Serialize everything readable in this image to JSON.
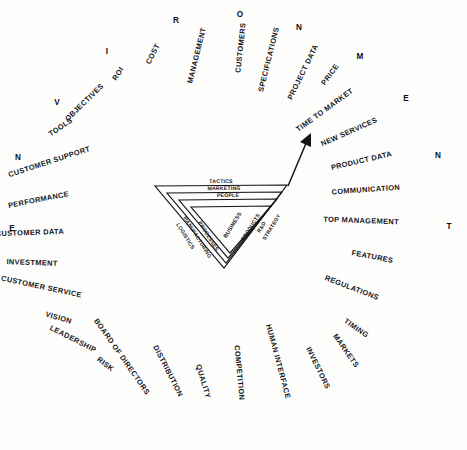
{
  "figure": {
    "background_color": "#fdfdfc",
    "ink_color": "#141418"
  },
  "environment_word": {
    "text": "ENVIRONMENT",
    "letters": [
      "E",
      "N",
      "V",
      "I",
      "R",
      "O",
      "N",
      "M",
      "E",
      "N",
      "T"
    ]
  },
  "env_letters": [
    {
      "char": "E",
      "x": 12,
      "y": 231
    },
    {
      "char": "N",
      "x": 18,
      "y": 160
    },
    {
      "char": "V",
      "x": 57,
      "y": 105
    },
    {
      "char": "I",
      "x": 107,
      "y": 54
    },
    {
      "char": "R",
      "x": 176,
      "y": 23
    },
    {
      "char": "O",
      "x": 240,
      "y": 17
    },
    {
      "char": "N",
      "x": 299,
      "y": 30
    },
    {
      "char": "M",
      "x": 360,
      "y": 59
    },
    {
      "char": "E",
      "x": 406,
      "y": 101
    },
    {
      "char": "N",
      "x": 438,
      "y": 158
    },
    {
      "char": "T",
      "x": 449,
      "y": 229
    }
  ],
  "ring_labels": [
    {
      "text": "ROI",
      "x": 120,
      "y": 75,
      "rot": -56
    },
    {
      "text": "COST",
      "x": 155,
      "y": 55,
      "rot": -63
    },
    {
      "text": "MANAGEMENT",
      "x": 199,
      "y": 56,
      "rot": -76
    },
    {
      "text": "CUSTOMERS",
      "x": 243,
      "y": 48,
      "rot": -84
    },
    {
      "text": "SPECIFICATIONS",
      "x": 271,
      "y": 60,
      "rot": -76
    },
    {
      "text": "PROJECT DATA",
      "x": 305,
      "y": 73,
      "rot": -64
    },
    {
      "text": "PRICE",
      "x": 332,
      "y": 76,
      "rot": -54
    },
    {
      "text": "TIME TO MARKET",
      "x": 326,
      "y": 112,
      "rot": -36
    },
    {
      "text": "NEW SERVICES",
      "x": 350,
      "y": 134,
      "rot": -24
    },
    {
      "text": "PRODUCT DATA",
      "x": 362,
      "y": 163,
      "rot": -13
    },
    {
      "text": "COMMUNICATION",
      "x": 366,
      "y": 192,
      "rot": -4
    },
    {
      "text": "TOP MANAGEMENT",
      "x": 361,
      "y": 223,
      "rot": 2
    },
    {
      "text": "FEATURES",
      "x": 372,
      "y": 259,
      "rot": 11
    },
    {
      "text": "REGULATIONS",
      "x": 351,
      "y": 290,
      "rot": 21
    },
    {
      "text": "TIMING",
      "x": 355,
      "y": 330,
      "rot": 35
    },
    {
      "text": "MARKETS",
      "x": 344,
      "y": 352,
      "rot": 55
    },
    {
      "text": "INVESTORS",
      "x": 316,
      "y": 369,
      "rot": 64
    },
    {
      "text": "HUMAN INTERFACE",
      "x": 276,
      "y": 362,
      "rot": 75
    },
    {
      "text": "COMPETITION",
      "x": 237,
      "y": 373,
      "rot": 85
    },
    {
      "text": "QUALITY",
      "x": 201,
      "y": 382,
      "rot": 73
    },
    {
      "text": "DISTRIBUTION",
      "x": 166,
      "y": 372,
      "rot": 63
    },
    {
      "text": "BOARD OF DIRECTORS",
      "x": 120,
      "y": 358,
      "rot": 55
    },
    {
      "text": "RISK",
      "x": 104,
      "y": 366,
      "rot": 37
    },
    {
      "text": "LEADERSHIP",
      "x": 72,
      "y": 341,
      "rot": 27
    },
    {
      "text": "VISION",
      "x": 58,
      "y": 320,
      "rot": 16
    },
    {
      "text": "CUSTOMER SERVICE",
      "x": 41,
      "y": 289,
      "rot": 12
    },
    {
      "text": "INVESTMENT",
      "x": 32,
      "y": 265,
      "rot": 2
    },
    {
      "text": "CUSTOMER DATA",
      "x": 30,
      "y": 235,
      "rot": -2
    },
    {
      "text": "PERFORMANCE",
      "x": 39,
      "y": 202,
      "rot": -11
    },
    {
      "text": "CUSTOMER SUPPORT",
      "x": 50,
      "y": 164,
      "rot": -18
    },
    {
      "text": "TOOLS",
      "x": 62,
      "y": 129,
      "rot": -34
    },
    {
      "text": "OBJECTIVES",
      "x": 86,
      "y": 104,
      "rot": -44
    }
  ],
  "triangle": {
    "center_label": "BUSINESS",
    "rings": [
      {
        "name": "outer",
        "top_label": "TACTICS",
        "right_label": "STRATEGY",
        "left_label": "LOGISTICS"
      },
      {
        "name": "second",
        "top_label": "MARKETING",
        "right_label": "R&D",
        "left_label": "MANUFACTURING"
      },
      {
        "name": "third",
        "top_label": "PEOPLE",
        "right_label": "PRODUCTS",
        "left_label": "PROCESSES"
      }
    ]
  },
  "arrow": {
    "name": "growth-arrow",
    "from": {
      "x": 288,
      "y": 186
    },
    "to": {
      "x": 311,
      "y": 134
    }
  }
}
